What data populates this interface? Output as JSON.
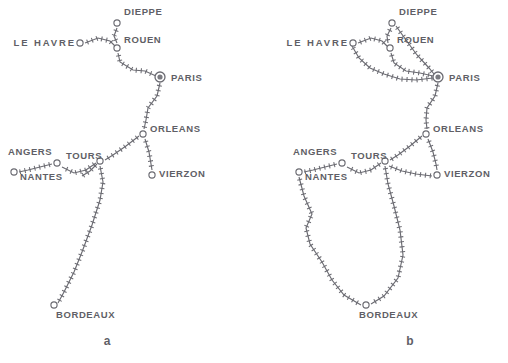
{
  "figure": {
    "type": "network-diagram",
    "background_color": "#ffffff",
    "line_color": "#6b6b72",
    "label_color": "#5f5f66",
    "hub_fill_color": "#7a7a80"
  },
  "panels": [
    {
      "id": "a",
      "caption": "a",
      "caption_pos": {
        "x": 107,
        "y": 345
      },
      "cities": [
        {
          "name": "DIEPPE",
          "node": {
            "x": 117,
            "y": 23
          },
          "label": {
            "x": 124,
            "y": 15
          },
          "anchor": "start",
          "type": "station"
        },
        {
          "name": "ROUEN",
          "node": {
            "x": 117,
            "y": 48
          },
          "label": {
            "x": 124,
            "y": 43
          },
          "anchor": "start",
          "type": "station"
        },
        {
          "name": "LE HAVRE",
          "node": {
            "x": 80,
            "y": 43
          },
          "label": {
            "x": 76,
            "y": 46
          },
          "anchor": "end",
          "type": "station",
          "wide": true
        },
        {
          "name": "PARIS",
          "node": {
            "x": 160,
            "y": 77
          },
          "label": {
            "x": 171,
            "y": 81
          },
          "anchor": "start",
          "type": "hub"
        },
        {
          "name": "ORLEANS",
          "node": {
            "x": 143,
            "y": 134
          },
          "label": {
            "x": 150,
            "y": 132
          },
          "anchor": "start",
          "type": "station"
        },
        {
          "name": "VIERZON",
          "node": {
            "x": 152,
            "y": 175
          },
          "label": {
            "x": 159,
            "y": 177
          },
          "anchor": "start",
          "type": "station"
        },
        {
          "name": "TOURS",
          "node": {
            "x": 100,
            "y": 161
          },
          "label": {
            "x": 66,
            "y": 159
          },
          "anchor": "start",
          "type": "station"
        },
        {
          "name": "ANGERS",
          "node": {
            "x": 57,
            "y": 163
          },
          "label": {
            "x": 8,
            "y": 155
          },
          "anchor": "start",
          "type": "station"
        },
        {
          "name": "NANTES",
          "node": {
            "x": 14,
            "y": 172
          },
          "label": {
            "x": 20,
            "y": 180
          },
          "anchor": "start",
          "type": "station"
        },
        {
          "name": "BORDEAUX",
          "node": {
            "x": 54,
            "y": 305
          },
          "label": {
            "x": 56,
            "y": 318
          },
          "anchor": "start",
          "type": "station"
        }
      ],
      "links": [
        {
          "from": "DIEPPE",
          "to": "ROUEN",
          "path": "M117,28 L114,36 L117,43"
        },
        {
          "from": "LE HAVRE",
          "to": "ROUEN",
          "path": "M85,43 L98,38 L110,41 L115,46"
        },
        {
          "from": "ROUEN",
          "to": "PARIS",
          "path": "M118,53 L120,62 L133,70 L145,71 L156,76"
        },
        {
          "from": "PARIS",
          "to": "ORLEANS",
          "path": "M160,83 L157,96 L148,108 L146,120 L144,129"
        },
        {
          "from": "ORLEANS",
          "to": "VIERZON",
          "path": "M145,139 L149,152 L151,164 L152,170"
        },
        {
          "from": "ORLEANS",
          "to": "TOURS",
          "path": "M139,136 L126,146 L113,155 L105,160"
        },
        {
          "from": "TOURS",
          "to": "ANGERS",
          "path": "M96,163 L86,170 L74,173 L62,167"
        },
        {
          "from": "ANGERS",
          "to": "NANTES",
          "path": "M52,164 L40,167 L28,170 L19,172"
        },
        {
          "from": "TOURS",
          "to": "BORDEAUX",
          "path": "M100,166 L103,182 L100,200 L92,225 L82,252 L74,272 L64,292 L58,303"
        },
        {
          "from": "TOURS",
          "to": "SOUTH_SPUR",
          "path": "M97,164 L90,171 L82,176"
        }
      ]
    },
    {
      "id": "b",
      "caption": "b",
      "caption_pos": {
        "x": 156,
        "y": 345
      },
      "cities": [
        {
          "name": "DIEPPE",
          "node": {
            "x": 138,
            "y": 23
          },
          "label": {
            "x": 145,
            "y": 15
          },
          "anchor": "start",
          "type": "station"
        },
        {
          "name": "ROUEN",
          "node": {
            "x": 136,
            "y": 48
          },
          "label": {
            "x": 143,
            "y": 43
          },
          "anchor": "start",
          "type": "station"
        },
        {
          "name": "LE HAVRE",
          "node": {
            "x": 99,
            "y": 43
          },
          "label": {
            "x": 95,
            "y": 46
          },
          "anchor": "end",
          "type": "station",
          "wide": true
        },
        {
          "name": "PARIS",
          "node": {
            "x": 184,
            "y": 77
          },
          "label": {
            "x": 195,
            "y": 81
          },
          "anchor": "start",
          "type": "hub"
        },
        {
          "name": "ORLEANS",
          "node": {
            "x": 172,
            "y": 134
          },
          "label": {
            "x": 179,
            "y": 132
          },
          "anchor": "start",
          "type": "station"
        },
        {
          "name": "VIERZON",
          "node": {
            "x": 183,
            "y": 175
          },
          "label": {
            "x": 190,
            "y": 177
          },
          "anchor": "start",
          "type": "station"
        },
        {
          "name": "TOURS",
          "node": {
            "x": 131,
            "y": 161
          },
          "label": {
            "x": 97,
            "y": 159
          },
          "anchor": "start",
          "type": "station"
        },
        {
          "name": "ANGERS",
          "node": {
            "x": 88,
            "y": 163
          },
          "label": {
            "x": 39,
            "y": 155
          },
          "anchor": "start",
          "type": "station"
        },
        {
          "name": "NANTES",
          "node": {
            "x": 45,
            "y": 172
          },
          "label": {
            "x": 51,
            "y": 180
          },
          "anchor": "start",
          "type": "station"
        },
        {
          "name": "BORDEAUX",
          "node": {
            "x": 112,
            "y": 305
          },
          "label": {
            "x": 105,
            "y": 318
          },
          "anchor": "start",
          "type": "station"
        }
      ],
      "links": [
        {
          "from": "DIEPPE",
          "to": "ROUEN",
          "path": "M137,28 L133,36 L134,43"
        },
        {
          "from": "DIEPPE",
          "to": "PARIS",
          "path": "M142,26 L152,40 L163,55 L175,68 L180,74"
        },
        {
          "from": "LE HAVRE",
          "to": "ROUEN",
          "path": "M104,43 L117,38 L128,41 L133,46"
        },
        {
          "from": "LE HAVRE",
          "to": "PARIS",
          "path": "M98,46 L105,58 L116,68 L130,74 L146,79 L162,80 L179,78"
        },
        {
          "from": "ROUEN",
          "to": "PARIS",
          "path": "M137,53 L140,63 L152,71 L166,73 L179,76"
        },
        {
          "from": "PARIS",
          "to": "ORLEANS",
          "path": "M184,83 L181,96 L173,108 L172,120 L173,129"
        },
        {
          "from": "ORLEANS",
          "to": "VIERZON",
          "path": "M174,139 L179,152 L182,164 L183,170"
        },
        {
          "from": "ORLEANS",
          "to": "TOURS",
          "path": "M168,136 L156,146 L144,155 L136,160"
        },
        {
          "from": "TOURS",
          "to": "VIERZON",
          "path": "M135,166 L148,171 L162,174 L178,176"
        },
        {
          "from": "TOURS",
          "to": "ANGERS",
          "path": "M127,163 L117,170 L105,173 L93,167"
        },
        {
          "from": "ANGERS",
          "to": "NANTES",
          "path": "M83,164 L71,167 L59,170 L50,172"
        },
        {
          "from": "TOURS",
          "to": "BORDEAUX",
          "path": "M131,166 L134,184 L140,206 L146,230 L149,255 L144,278 L130,296 L117,304"
        },
        {
          "from": "NANTES",
          "to": "BORDEAUX",
          "path": "M45,177 L50,196 L58,214 L52,228 L56,244 L68,262 L78,280 L90,295 L107,305"
        }
      ]
    }
  ]
}
